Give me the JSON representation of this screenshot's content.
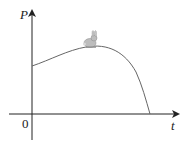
{
  "diagram": {
    "y_axis_label": "P",
    "x_axis_label": "t",
    "origin_label": "0",
    "curve_description": "Population P rises from a positive initial value, peaks, then falls to zero",
    "annotation_icon": "rabbit-icon",
    "colors": {
      "axes": "#222222",
      "curve": "#555555",
      "rabbit": "#b8b8b8"
    }
  }
}
